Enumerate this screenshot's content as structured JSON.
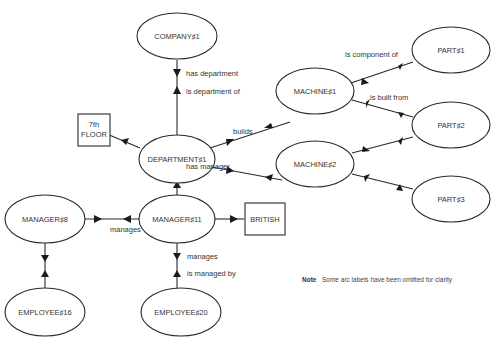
{
  "diagram": {
    "type": "semantic-network",
    "nodes": {
      "company1": {
        "label": "COMPANY♯1",
        "shape": "ellipse"
      },
      "department1": {
        "label": "DEPARTMENT♯1",
        "shape": "ellipse"
      },
      "floor": {
        "label_line1": "7th",
        "label_line2": "FLOOR",
        "shape": "rect"
      },
      "machine1": {
        "label": "MACHINE♯1",
        "shape": "ellipse"
      },
      "machine2": {
        "label": "MACHINE♯2",
        "shape": "ellipse"
      },
      "part1": {
        "label": "PART♯1",
        "shape": "ellipse"
      },
      "part2": {
        "label": "PART♯2",
        "shape": "ellipse"
      },
      "part3": {
        "label": "PART♯3",
        "shape": "ellipse"
      },
      "manager11": {
        "label": "MANAGER♯11",
        "shape": "ellipse"
      },
      "manager8": {
        "label": "MANAGER♯8",
        "shape": "ellipse"
      },
      "british": {
        "label": "BRITISH",
        "shape": "rect"
      },
      "employee16": {
        "label": "EMPLOYEE♯16",
        "shape": "ellipse"
      },
      "employee20": {
        "label": "EMPLOYEE♯20",
        "shape": "ellipse"
      }
    },
    "edge_labels": {
      "has_department": "has department",
      "is_department_of": "is department of",
      "is_component_of": "is component of",
      "is_built_from": "is built from",
      "builds": "builds",
      "has_manager": "has manager",
      "manages_left": "manages",
      "manages_down": "manages",
      "is_managed_by": "is managed by"
    },
    "note": {
      "label": "Note",
      "text": "Some arc labels have been omitted for clarity"
    }
  }
}
